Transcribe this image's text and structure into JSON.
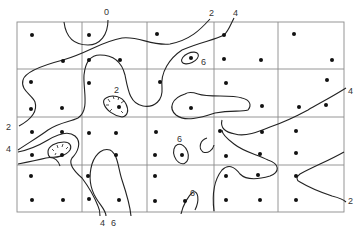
{
  "figure": {
    "type": "contour-map",
    "grid": {
      "columns": 5,
      "rows": 4
    },
    "contour_labels": [
      {
        "id": "label-0-top",
        "text": "0",
        "x": 106,
        "y": 15
      },
      {
        "id": "label-2-top",
        "text": "2",
        "x": 211,
        "y": 15
      },
      {
        "id": "label-4-top",
        "text": "4",
        "x": 235,
        "y": 15
      },
      {
        "id": "label-6-upper",
        "text": "6",
        "x": 201,
        "y": 64
      },
      {
        "id": "label-2-depression-upper",
        "text": "2",
        "x": 115,
        "y": 92
      },
      {
        "id": "label-4-right",
        "text": "4",
        "x": 350,
        "y": 92
      },
      {
        "id": "label-6-center",
        "text": "6",
        "x": 178,
        "y": 141
      },
      {
        "id": "label-2-left",
        "text": "2",
        "x": 7,
        "y": 130
      },
      {
        "id": "label-4-left",
        "text": "4",
        "x": 7,
        "y": 152
      },
      {
        "id": "label-6-lower-right",
        "text": "6",
        "x": 191,
        "y": 195
      },
      {
        "id": "label-2-right",
        "text": "2",
        "x": 350,
        "y": 203
      },
      {
        "id": "label-4-bottom",
        "text": "4",
        "x": 101,
        "y": 225
      },
      {
        "id": "label-6-bottom",
        "text": "6",
        "x": 112,
        "y": 225
      }
    ],
    "contour_values": [
      0,
      2,
      4,
      6
    ],
    "colors": {
      "line": "#222222",
      "grid": "#8a8a8a",
      "dot": "#111111",
      "background": "#ffffff"
    }
  }
}
